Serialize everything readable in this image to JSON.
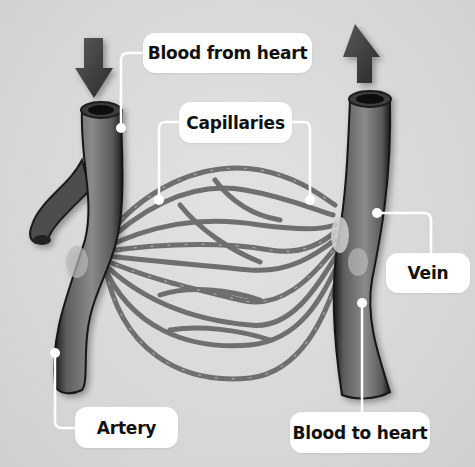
{
  "diagram": {
    "labels": {
      "blood_from_heart": "Blood from heart",
      "capillaries": "Capillaries",
      "vein": "Vein",
      "artery": "Artery",
      "blood_to_heart": "Blood to heart"
    },
    "arrows": {
      "in": "down-arrow (blood entering artery)",
      "out": "up-arrow (blood leaving vein)"
    },
    "colors": {
      "background": "#d8d8d8",
      "vessel": "#6a6a6a",
      "vessel_dark": "#1e1e1e",
      "vessel_light": "#8e8e8e",
      "capillary": "#7a7a7a",
      "label_bg": "#ffffff",
      "label_text": "#111111",
      "leader_line": "#ffffff"
    }
  }
}
